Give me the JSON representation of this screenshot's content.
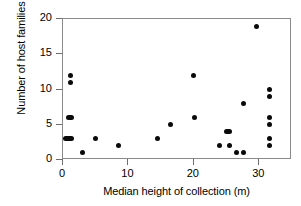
{
  "chart_data": {
    "type": "scatter",
    "title": "",
    "xlabel": "Median height of collection (m)",
    "ylabel": "Number of host families",
    "xlim": [
      0,
      35
    ],
    "ylim": [
      0,
      20
    ],
    "xticks": [
      0,
      10,
      20,
      30
    ],
    "yticks": [
      0,
      5,
      10,
      15,
      20
    ],
    "xtick_labels": [
      "0",
      "10",
      "20",
      "30"
    ],
    "ytick_labels": [
      "0",
      "5",
      "10",
      "15",
      "20"
    ],
    "grid": false,
    "legend": null,
    "marker": {
      "shape": "circle",
      "color": "#0a0a0a",
      "size_px": 5
    },
    "frame_color": "#8a8a8a",
    "background": "#ffffff",
    "n_points": 26,
    "points": [
      {
        "x": 1.2,
        "y": 12,
        "style": "dot"
      },
      {
        "x": 1.2,
        "y": 11,
        "style": "dot"
      },
      {
        "x": 1.1,
        "y": 6,
        "style": "wide2"
      },
      {
        "x": 0.8,
        "y": 3,
        "style": "wide"
      },
      {
        "x": 3.0,
        "y": 1,
        "style": "dot"
      },
      {
        "x": 4.9,
        "y": 3,
        "style": "dot"
      },
      {
        "x": 8.5,
        "y": 2,
        "style": "dot"
      },
      {
        "x": 14.4,
        "y": 3,
        "style": "dot"
      },
      {
        "x": 16.4,
        "y": 5,
        "style": "dot"
      },
      {
        "x": 20.0,
        "y": 12,
        "style": "dot"
      },
      {
        "x": 20.1,
        "y": 6,
        "style": "dot"
      },
      {
        "x": 23.9,
        "y": 2,
        "style": "dot"
      },
      {
        "x": 25.2,
        "y": 4,
        "style": "wide2"
      },
      {
        "x": 25.4,
        "y": 2,
        "style": "dot"
      },
      {
        "x": 26.5,
        "y": 1,
        "style": "dot"
      },
      {
        "x": 27.6,
        "y": 1,
        "style": "dot"
      },
      {
        "x": 27.6,
        "y": 8,
        "style": "dot"
      },
      {
        "x": 29.5,
        "y": 19,
        "style": "dot"
      },
      {
        "x": 31.5,
        "y": 10,
        "style": "dot"
      },
      {
        "x": 31.5,
        "y": 9,
        "style": "dot"
      },
      {
        "x": 31.5,
        "y": 6,
        "style": "dot"
      },
      {
        "x": 31.5,
        "y": 5,
        "style": "dot"
      },
      {
        "x": 31.5,
        "y": 3,
        "style": "dot"
      },
      {
        "x": 31.5,
        "y": 2,
        "style": "dot"
      }
    ]
  }
}
